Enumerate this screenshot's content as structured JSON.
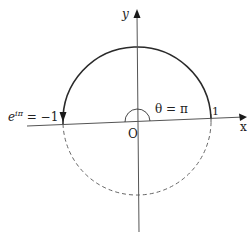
{
  "diagram": {
    "type": "unit-circle-euler",
    "axes": {
      "x_label": "x",
      "y_label": "y",
      "origin_label": "O"
    },
    "labels": {
      "point_one": "1",
      "angle": "θ = π",
      "euler_base": "e",
      "euler_exp": "iπ",
      "euler_rhs": " = −1"
    },
    "arcs": [
      {
        "name": "upper-semicircle",
        "style": "solid",
        "direction": "counterclockwise from 1 to -1"
      },
      {
        "name": "lower-semicircle",
        "style": "dashed"
      }
    ],
    "caption": "",
    "colors": {
      "stroke": "#2a2a2a",
      "axis": "#555555",
      "dashed": "#666666"
    }
  }
}
